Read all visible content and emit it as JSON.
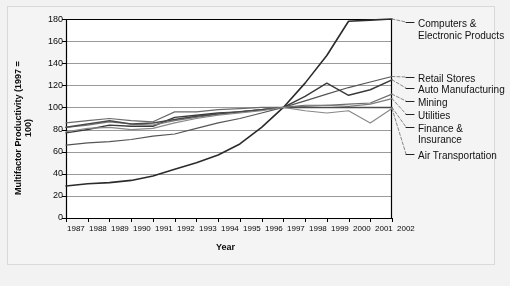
{
  "chart_data": {
    "type": "line",
    "title": "",
    "xlabel": "Year",
    "ylabel": "Multifactor Productivity (1997 = 100)",
    "ylim": [
      0,
      180
    ],
    "yticks": [
      0,
      20,
      40,
      60,
      80,
      100,
      120,
      140,
      160,
      180
    ],
    "grid": true,
    "legend_position": "right-outside",
    "categories": [
      1987,
      1988,
      1989,
      1990,
      1991,
      1992,
      1993,
      1994,
      1995,
      1996,
      1997,
      1998,
      1999,
      2000,
      2001,
      2002
    ],
    "xticklabels": [
      "1987",
      "1988",
      "1989",
      "1990",
      "1991",
      "1992",
      "1993",
      "1994",
      "1995",
      "1996",
      "1997",
      "1998",
      "1999",
      "2000",
      "2001",
      "2002"
    ],
    "series": [
      {
        "name": "Computers & Electronic Products",
        "color": "#2b2b2b",
        "width": 1.6,
        "values": [
          29,
          31,
          32,
          34,
          38,
          44,
          50,
          57,
          67,
          82,
          100,
          122,
          147,
          178,
          179,
          180
        ]
      },
      {
        "name": "Retail Stores",
        "color": "#555555",
        "width": 1.2,
        "values": [
          66,
          68,
          69,
          71,
          74,
          76,
          81,
          86,
          90,
          95,
          100,
          106,
          112,
          118,
          123,
          128
        ]
      },
      {
        "name": "Auto Manufacturing",
        "color": "#3a3a3a",
        "width": 1.4,
        "values": [
          77,
          80,
          84,
          83,
          83,
          91,
          93,
          95,
          96,
          98,
          100,
          110,
          122,
          111,
          116,
          125
        ]
      },
      {
        "name": "Mining",
        "color": "#6b6b6b",
        "width": 1.2,
        "values": [
          86,
          88,
          90,
          88,
          87,
          96,
          96,
          98,
          99,
          100,
          100,
          102,
          102,
          103,
          104,
          112
        ]
      },
      {
        "name": "Utilities",
        "color": "#7d7d7d",
        "width": 1.2,
        "values": [
          82,
          84,
          87,
          85,
          84,
          88,
          91,
          94,
          96,
          98,
          100,
          101,
          102,
          101,
          103,
          108
        ]
      },
      {
        "name": "Finance & Insurance",
        "color": "#4a4a4a",
        "width": 1.5,
        "values": [
          82,
          85,
          88,
          85,
          86,
          89,
          92,
          94,
          96,
          98,
          100,
          100,
          100,
          100,
          100,
          100
        ]
      },
      {
        "name": "Air Transportation",
        "color": "#888888",
        "width": 1.2,
        "values": [
          78,
          81,
          82,
          80,
          81,
          86,
          90,
          93,
          95,
          97,
          100,
          97,
          95,
          97,
          86,
          99
        ]
      }
    ],
    "legend_entries": [
      {
        "label_line1": "Computers &",
        "label_line2": "Electronic Products",
        "anchor_value": 180
      },
      {
        "label_line1": "Retail Stores",
        "label_line2": "",
        "anchor_value": 128
      },
      {
        "label_line1": "Auto Manufacturing",
        "label_line2": "",
        "anchor_value": 125
      },
      {
        "label_line1": "Mining",
        "label_line2": "",
        "anchor_value": 112
      },
      {
        "label_line1": "Utilities",
        "label_line2": "",
        "anchor_value": 108
      },
      {
        "label_line1": "Finance &",
        "label_line2": "Insurance",
        "anchor_value": 100
      },
      {
        "label_line1": "Air Transportation",
        "label_line2": "",
        "anchor_value": 86
      }
    ]
  },
  "axis": {
    "y_title": "Multifactor Productivity (1997 = 100)",
    "x_title": "Year",
    "yticks": [
      "180",
      "160",
      "140",
      "120",
      "100",
      "80",
      "60",
      "40",
      "20",
      "0"
    ],
    "xticks": [
      "1987",
      "1988",
      "1989",
      "1990",
      "1991",
      "1992",
      "1993",
      "1994",
      "1995",
      "1996",
      "1997",
      "1998",
      "1999",
      "2000",
      "2001",
      "2002"
    ]
  },
  "legend": {
    "items": [
      "Computers &",
      "Electronic Products",
      "Retail Stores",
      "Auto Manufacturing",
      "Mining",
      "Utilities",
      "Finance &",
      "Insurance",
      "Air Transportation"
    ]
  },
  "colors": {
    "background": "#f2f2f2",
    "panel": "#f4f4f4",
    "plot": "#ffffff",
    "grid": "#9a9a9a",
    "axis": "#000000",
    "text": "#0a0a0a"
  }
}
